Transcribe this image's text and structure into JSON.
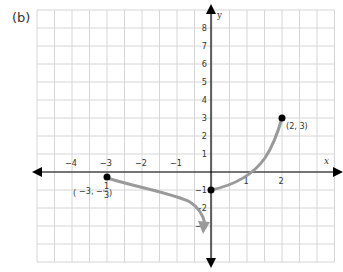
{
  "figure_label": "(b)",
  "chart_data": {
    "type": "line",
    "title": "",
    "xlabel": "x",
    "ylabel": "y",
    "xlim": [
      -5,
      3.5
    ],
    "ylim": [
      -5,
      9
    ],
    "grid": true,
    "x_ticks": [
      -4,
      -3,
      -2,
      -1,
      1,
      2
    ],
    "y_ticks": [
      -3,
      -2,
      -1,
      1,
      2,
      3,
      4,
      5,
      6,
      7,
      8
    ],
    "series": [
      {
        "name": "left branch (open end, arrow toward x=0)",
        "points": [
          [
            -3,
            -0.333
          ],
          [
            -1.5,
            -1
          ],
          [
            -0.5,
            -1.8
          ],
          [
            -0.3,
            -2.8
          ]
        ],
        "start_marker": "closed",
        "end": "arrow"
      },
      {
        "name": "right branch",
        "points": [
          [
            0,
            -1
          ],
          [
            0.5,
            -0.6
          ],
          [
            1,
            0
          ],
          [
            1.5,
            1
          ],
          [
            2,
            3
          ]
        ],
        "start_marker": "closed",
        "end_marker": "closed"
      }
    ],
    "annotations": [
      {
        "text": "(2, 3)",
        "x": 2,
        "y": 3
      },
      {
        "text": "(−3, −1/3)",
        "x": -3,
        "y": -0.333
      }
    ],
    "colors": {
      "curve": "#9a9a9a",
      "axis": "#000000",
      "grid": "#d6d6d6",
      "point": "#000000"
    }
  },
  "labels": {
    "xaxis": "x",
    "yaxis": "y",
    "pt1": "(2, 3)",
    "pt2_a": "−3, −",
    "pt2_num": "1",
    "pt2_den": "3"
  }
}
